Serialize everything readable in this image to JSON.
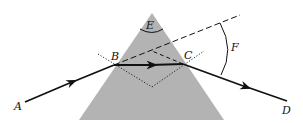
{
  "diagram": {
    "colors": {
      "prism_fill": "#b3b3b3",
      "ray": "#111111",
      "background": "#ffffff"
    },
    "labels": {
      "A": "A",
      "B": "B",
      "C": "C",
      "D": "D",
      "E": "E",
      "F": "F"
    },
    "elements": [
      {
        "id": "prism",
        "type": "triangle",
        "description": "glass prism"
      },
      {
        "id": "incident-ray",
        "from": "A",
        "to": "B",
        "style": "solid-arrow"
      },
      {
        "id": "internal-ray",
        "from": "B",
        "to": "C",
        "style": "solid-arrow"
      },
      {
        "id": "emergent-ray",
        "from": "C",
        "to": "D",
        "style": "solid-arrow"
      },
      {
        "id": "extension-incident",
        "style": "dashed",
        "description": "extension of incident ray"
      },
      {
        "id": "extension-emergent",
        "style": "dashed",
        "description": "backward extension of emergent ray"
      },
      {
        "id": "normal-B",
        "style": "dotted"
      },
      {
        "id": "normal-C",
        "style": "dotted"
      },
      {
        "id": "apex-angle",
        "label": "E"
      },
      {
        "id": "deviation-angle",
        "label": "F"
      }
    ]
  }
}
